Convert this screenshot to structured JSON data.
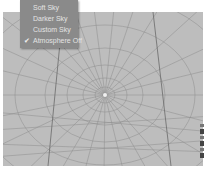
{
  "menu": {
    "items": [
      {
        "label": "Soft Sky",
        "checked": false
      },
      {
        "label": "Darker Sky",
        "checked": false
      },
      {
        "label": "Custom Sky",
        "checked": false
      },
      {
        "label": "Atmosphere Off",
        "checked": true
      }
    ],
    "check_glyph": "✔"
  },
  "viewport": {
    "background": "#bdbdbd",
    "grid_color": "#8c8c8c",
    "center": [
      102,
      83
    ]
  },
  "side_tools": {
    "count": 6
  }
}
